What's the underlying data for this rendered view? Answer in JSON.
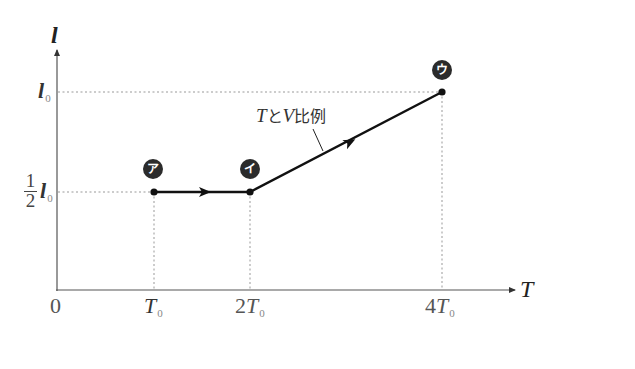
{
  "diagram": {
    "y_axis": {
      "label": "l"
    },
    "x_axis": {
      "label": "T",
      "origin_label": "0"
    },
    "y_ticks": [
      {
        "main": "l",
        "sub": "0",
        "meaning": "l0"
      },
      {
        "fraction_num": "1",
        "fraction_den": "2",
        "main": "l",
        "sub": "0",
        "meaning": "1/2 l0"
      }
    ],
    "x_ticks": [
      {
        "prefix": "",
        "main": "T",
        "sub": "0"
      },
      {
        "prefix": "2",
        "main": "T",
        "sub": "0"
      },
      {
        "prefix": "4",
        "main": "T",
        "sub": "0"
      }
    ],
    "points": [
      {
        "name": "ア",
        "T": "T0",
        "l": "1/2 l0"
      },
      {
        "name": "イ",
        "T": "2T0",
        "l": "1/2 l0"
      },
      {
        "name": "ウ",
        "T": "4T0",
        "l": "l0"
      }
    ],
    "annotation": {
      "text_T": "T",
      "text_to": "と",
      "text_V": "V",
      "text_rest": "比例"
    },
    "colors": {
      "line": "#111111",
      "axis": "#555555",
      "guide": "#888888",
      "badge": "#2b2b2b"
    }
  }
}
